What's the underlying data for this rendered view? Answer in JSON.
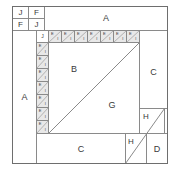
{
  "diagram": {
    "width": 172,
    "height": 170,
    "colors": {
      "line": "#8a8a8a",
      "outer_line": "#6e6e6e",
      "label": "#3a3a3a",
      "background": "#ffffff",
      "shade": "#e8e8e8"
    },
    "corner_grid": {
      "name": "four-patch-corner",
      "rows": [
        [
          "J",
          "F"
        ],
        [
          "F",
          "J"
        ]
      ]
    },
    "patches": {
      "top_bar": "A",
      "left_bar": "A",
      "right_bar": "C",
      "bottom_bar": "C",
      "inner_upper_left": "B",
      "inner_lower_right": "G",
      "corner_small_top": "H",
      "corner_small_bottom": "H",
      "corner_square": "D",
      "strip_corner": "J"
    },
    "strip_unit": {
      "upper_label": "E",
      "lower_label": "I",
      "top_strip_count": 7,
      "left_strip_count": 7
    }
  }
}
